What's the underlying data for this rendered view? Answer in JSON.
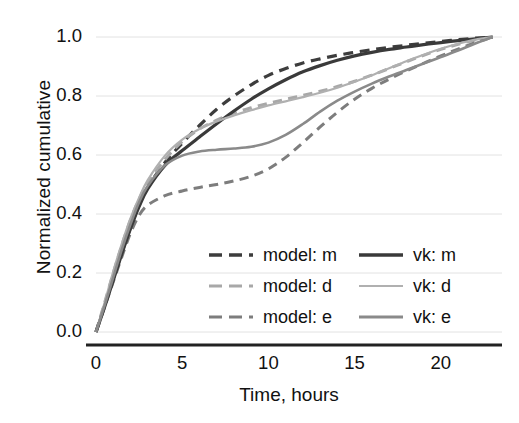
{
  "chart_data": {
    "type": "line",
    "title": "",
    "xlabel": "Time, hours",
    "ylabel": "Normalized cumulative",
    "xlim": [
      0,
      23.2
    ],
    "ylim": [
      0.0,
      1.0
    ],
    "xticks": [
      "0",
      "5",
      "10",
      "15",
      "20"
    ],
    "xtick_values": [
      0,
      5,
      10,
      15,
      20
    ],
    "yticks": [
      "0.0",
      "0.2",
      "0.4",
      "0.6",
      "0.8",
      "1.0"
    ],
    "ytick_values": [
      0.0,
      0.2,
      0.4,
      0.6,
      0.8,
      1.0
    ],
    "grid": "horizontal",
    "legend_position": "lower-right-inside",
    "series": [
      {
        "name": "model: m",
        "style": "dashed",
        "color": "#3d3d3d",
        "width": 3.2,
        "x": [
          0,
          0.5,
          1,
          1.5,
          2,
          2.5,
          3,
          4,
          5,
          6,
          7,
          8,
          9,
          10,
          11,
          12,
          13,
          14,
          15,
          16,
          17,
          18,
          19,
          20,
          21,
          22,
          23
        ],
        "y": [
          0.0,
          0.09,
          0.18,
          0.27,
          0.355,
          0.43,
          0.49,
          0.575,
          0.64,
          0.7,
          0.755,
          0.8,
          0.838,
          0.87,
          0.893,
          0.912,
          0.926,
          0.938,
          0.948,
          0.957,
          0.965,
          0.972,
          0.979,
          0.985,
          0.991,
          0.996,
          1.0
        ]
      },
      {
        "name": "model: d",
        "style": "dashed",
        "color": "#a8a8a8",
        "width": 3.0,
        "x": [
          0,
          0.5,
          1,
          1.5,
          2,
          2.5,
          3,
          4,
          5,
          6,
          7,
          8,
          9,
          10,
          11,
          12,
          13,
          14,
          15,
          16,
          17,
          18,
          19,
          20,
          21,
          22,
          23
        ],
        "y": [
          0.0,
          0.1,
          0.2,
          0.295,
          0.38,
          0.45,
          0.505,
          0.585,
          0.645,
          0.688,
          0.718,
          0.742,
          0.76,
          0.775,
          0.789,
          0.802,
          0.816,
          0.832,
          0.85,
          0.871,
          0.893,
          0.916,
          0.938,
          0.958,
          0.975,
          0.99,
          1.0
        ]
      },
      {
        "name": "model: e",
        "style": "dashed",
        "color": "#7d7d7d",
        "width": 3.0,
        "x": [
          0,
          0.5,
          1,
          1.5,
          2,
          2.5,
          3,
          4,
          5,
          6,
          7,
          8,
          9,
          10,
          11,
          12,
          13,
          14,
          15,
          16,
          17,
          18,
          19,
          20,
          21,
          22,
          23
        ],
        "y": [
          0.0,
          0.085,
          0.17,
          0.255,
          0.335,
          0.395,
          0.43,
          0.462,
          0.478,
          0.49,
          0.5,
          0.512,
          0.528,
          0.553,
          0.592,
          0.642,
          0.695,
          0.745,
          0.789,
          0.826,
          0.857,
          0.885,
          0.911,
          0.936,
          0.959,
          0.981,
          1.0
        ]
      },
      {
        "name": "vk: m",
        "style": "solid",
        "color": "#3a3a3a",
        "width": 3.2,
        "x": [
          0,
          0.5,
          1,
          1.5,
          2,
          2.5,
          3,
          4,
          5,
          6,
          7,
          8,
          9,
          10,
          11,
          12,
          13,
          14,
          15,
          16,
          17,
          18,
          19,
          20,
          21,
          22,
          23
        ],
        "y": [
          0.0,
          0.085,
          0.175,
          0.265,
          0.35,
          0.425,
          0.485,
          0.565,
          0.615,
          0.661,
          0.706,
          0.749,
          0.789,
          0.824,
          0.855,
          0.882,
          0.903,
          0.921,
          0.936,
          0.948,
          0.958,
          0.966,
          0.974,
          0.981,
          0.988,
          0.994,
          1.0
        ]
      },
      {
        "name": "vk: d",
        "style": "solid",
        "color": "#b0b0b0",
        "width": 2.2,
        "x": [
          0,
          0.5,
          1,
          1.5,
          2,
          2.5,
          3,
          4,
          5,
          6,
          7,
          8,
          9,
          10,
          11,
          12,
          13,
          14,
          15,
          16,
          17,
          18,
          19,
          20,
          21,
          22,
          23
        ],
        "y": [
          0.0,
          0.1,
          0.205,
          0.3,
          0.385,
          0.455,
          0.515,
          0.598,
          0.652,
          0.688,
          0.714,
          0.734,
          0.752,
          0.768,
          0.782,
          0.796,
          0.811,
          0.828,
          0.848,
          0.87,
          0.894,
          0.918,
          0.94,
          0.96,
          0.977,
          0.991,
          1.0
        ]
      },
      {
        "name": "vk: e",
        "style": "solid",
        "color": "#8a8a8a",
        "width": 2.6,
        "x": [
          0,
          0.5,
          1,
          1.5,
          2,
          2.5,
          3,
          4,
          5,
          6,
          7,
          8,
          9,
          10,
          11,
          12,
          13,
          14,
          15,
          16,
          17,
          18,
          19,
          20,
          21,
          22,
          23
        ],
        "y": [
          0.0,
          0.09,
          0.185,
          0.28,
          0.365,
          0.44,
          0.495,
          0.565,
          0.598,
          0.612,
          0.618,
          0.622,
          0.628,
          0.642,
          0.668,
          0.705,
          0.747,
          0.784,
          0.815,
          0.842,
          0.866,
          0.888,
          0.91,
          0.932,
          0.954,
          0.978,
          1.0
        ]
      }
    ]
  },
  "legend": {
    "entries": [
      {
        "label": "model: m",
        "style": "dashed",
        "color": "#3d3d3d",
        "width": 3.4,
        "col": 0,
        "row": 0
      },
      {
        "label": "model: d",
        "style": "dashed",
        "color": "#a8a8a8",
        "width": 3.2,
        "col": 0,
        "row": 1
      },
      {
        "label": "model: e",
        "style": "dashed",
        "color": "#7d7d7d",
        "width": 3.2,
        "col": 0,
        "row": 2
      },
      {
        "label": "vk: m",
        "style": "solid",
        "color": "#3a3a3a",
        "width": 3.4,
        "col": 1,
        "row": 0
      },
      {
        "label": "vk: d",
        "style": "solid",
        "color": "#b0b0b0",
        "width": 2.2,
        "col": 1,
        "row": 1
      },
      {
        "label": "vk: e",
        "style": "solid",
        "color": "#8a8a8a",
        "width": 2.8,
        "col": 1,
        "row": 2
      }
    ]
  },
  "axes": {
    "axis_line_color": "#222222",
    "grid_color": "#e2e2e2",
    "background": "#ffffff"
  }
}
